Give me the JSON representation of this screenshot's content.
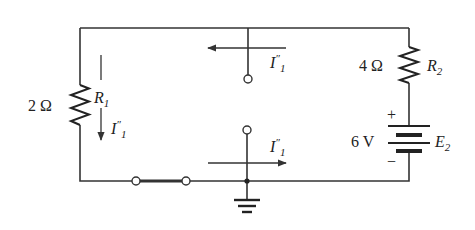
{
  "diagram": {
    "type": "circuit",
    "components": {
      "r1": {
        "name_base": "R",
        "name_sub": "1",
        "value": "2 Ω"
      },
      "r2": {
        "name_base": "R",
        "name_sub": "2",
        "value": "4 Ω"
      },
      "e2": {
        "name_base": "E",
        "name_sub": "2",
        "value": "6 V",
        "plus": "+",
        "minus": "−"
      }
    },
    "currents": {
      "r1_current": {
        "base": "I",
        "prime": "″",
        "sub": "1",
        "direction": "down"
      },
      "top_branch_current": {
        "base": "I",
        "prime": "″",
        "sub": "1",
        "direction": "left"
      },
      "bottom_branch_current": {
        "base": "I",
        "prime": "″",
        "sub": "1",
        "direction": "right"
      }
    },
    "colors": {
      "wire": "#333333",
      "background": "#ffffff"
    }
  }
}
